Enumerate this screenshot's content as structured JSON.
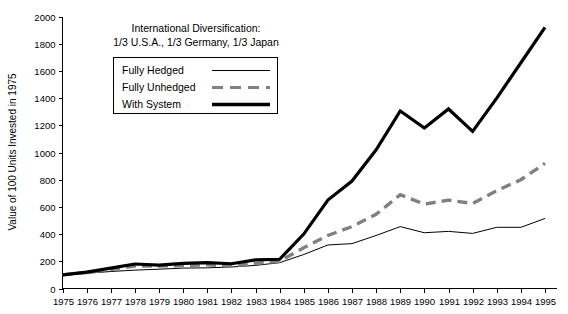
{
  "chart_data": {
    "type": "line",
    "title_line1": "International Diversification:",
    "title_line2": "1/3 U.S.A., 1/3 Germany, 1/3 Japan",
    "xlabel": "",
    "ylabel": "Value of 100 Units Invested in 1975",
    "xlim": [
      1975,
      1995
    ],
    "ylim": [
      0,
      2000
    ],
    "grid": false,
    "legend_position": "upper-left-inside",
    "x": [
      1975,
      1976,
      1977,
      1978,
      1979,
      1980,
      1981,
      1982,
      1983,
      1984,
      1985,
      1986,
      1987,
      1988,
      1989,
      1990,
      1991,
      1992,
      1993,
      1994,
      1995
    ],
    "categories": [
      "1975",
      "1976",
      "1977",
      "1978",
      "1979",
      "1980",
      "1981",
      "1982",
      "1983",
      "1984",
      "1985",
      "1986",
      "1987",
      "1988",
      "1989",
      "1990",
      "1991",
      "1992",
      "1993",
      "1994",
      "1995"
    ],
    "ytick_values": [
      0,
      200,
      400,
      600,
      800,
      1000,
      1200,
      1400,
      1600,
      1800,
      2000
    ],
    "ytick_labels": [
      "0",
      "200",
      "400",
      "600",
      "800",
      "1000",
      "1200",
      "1400",
      "1600",
      "1800",
      "2000"
    ],
    "series": [
      {
        "name": "Fully Hedged",
        "style": "thin-solid",
        "color": "#000000",
        "values": [
          100,
          112,
          125,
          135,
          142,
          150,
          152,
          158,
          170,
          190,
          250,
          320,
          330,
          390,
          455,
          410,
          420,
          405,
          450,
          450,
          515
        ]
      },
      {
        "name": "Fully Unhedged",
        "style": "dashed",
        "color": "#808080",
        "values": [
          100,
          118,
          140,
          165,
          165,
          168,
          175,
          165,
          185,
          200,
          300,
          390,
          455,
          545,
          690,
          620,
          650,
          625,
          720,
          800,
          920
        ]
      },
      {
        "name": "With System",
        "style": "thick-solid",
        "color": "#000000",
        "values": [
          100,
          120,
          150,
          180,
          172,
          185,
          190,
          182,
          210,
          215,
          400,
          650,
          790,
          1020,
          1305,
          1180,
          1320,
          1155,
          1400,
          1660,
          1920
        ]
      }
    ]
  },
  "legend": {
    "items": [
      {
        "label": "Fully Hedged",
        "swatch": "thin-solid-line-swatch"
      },
      {
        "label": "Fully Unhedged",
        "swatch": "dashed-line-swatch"
      },
      {
        "label": "With System",
        "swatch": "thick-solid-line-swatch"
      }
    ]
  }
}
